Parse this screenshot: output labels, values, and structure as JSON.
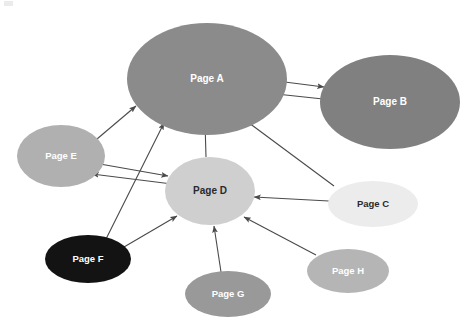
{
  "diagram": {
    "background_color": "#ffffff",
    "width": 473,
    "height": 328,
    "nodes": [
      {
        "id": "A",
        "label": "Page A",
        "cx": 207,
        "cy": 79,
        "rx": 80,
        "ry": 56,
        "fill": "#8b8b8b",
        "text_color": "#ffffff",
        "font_size": 10
      },
      {
        "id": "B",
        "label": "Page B",
        "cx": 390,
        "cy": 102,
        "rx": 70,
        "ry": 47,
        "fill": "#808080",
        "text_color": "#ffffff",
        "font_size": 10
      },
      {
        "id": "C",
        "label": "Page C",
        "cx": 373,
        "cy": 204,
        "rx": 45,
        "ry": 23,
        "fill": "#ececec",
        "text_color": "#2a2a2a",
        "font_size": 9.5
      },
      {
        "id": "D",
        "label": "Page D",
        "cx": 210,
        "cy": 191,
        "rx": 45,
        "ry": 34,
        "fill": "#cfcfcf",
        "text_color": "#2a2a2a",
        "font_size": 10
      },
      {
        "id": "E",
        "label": "Page E",
        "cx": 61,
        "cy": 156,
        "rx": 44,
        "ry": 31,
        "fill": "#b0b0b0",
        "text_color": "#ffffff",
        "font_size": 9.5
      },
      {
        "id": "F",
        "label": "Page F",
        "cx": 88,
        "cy": 259,
        "rx": 43,
        "ry": 24,
        "fill": "#131313",
        "text_color": "#ffffff",
        "font_size": 9.5
      },
      {
        "id": "G",
        "label": "Page G",
        "cx": 228,
        "cy": 294,
        "rx": 43,
        "ry": 23,
        "fill": "#999999",
        "text_color": "#ffffff",
        "font_size": 9.5
      },
      {
        "id": "H",
        "label": "Page H",
        "cx": 348,
        "cy": 271,
        "rx": 41,
        "ry": 22,
        "fill": "#b5b5b5",
        "text_color": "#ffffff",
        "font_size": 9.5
      }
    ],
    "edges": [
      {
        "id": "a-to-b",
        "from": "A",
        "to": "B",
        "x1": 269,
        "y1": 80,
        "x2": 324,
        "y2": 87,
        "arrow_end": true,
        "arrow_start": false
      },
      {
        "id": "b-to-a",
        "from": "B",
        "to": "A",
        "x1": 323,
        "y1": 99,
        "x2": 267,
        "y2": 93,
        "arrow_end": true,
        "arrow_start": false
      },
      {
        "id": "e-to-a",
        "from": "E",
        "to": "A",
        "x1": 97,
        "y1": 139,
        "x2": 136,
        "y2": 106,
        "arrow_end": true,
        "arrow_start": false
      },
      {
        "id": "f-to-a",
        "from": "F",
        "to": "A",
        "x1": 106,
        "y1": 239,
        "x2": 164,
        "y2": 123,
        "arrow_end": true,
        "arrow_start": false
      },
      {
        "id": "d-to-a",
        "from": "D",
        "to": "A",
        "x1": 206,
        "y1": 157,
        "x2": 205,
        "y2": 122,
        "arrow_end": true,
        "arrow_start": false
      },
      {
        "id": "c-to-a",
        "from": "C",
        "to": "A",
        "x1": 334,
        "y1": 186,
        "x2": 241,
        "y2": 117,
        "arrow_end": true,
        "arrow_start": false
      },
      {
        "id": "e-to-d",
        "from": "E",
        "to": "D",
        "x1": 100,
        "y1": 164,
        "x2": 168,
        "y2": 176,
        "arrow_end": true,
        "arrow_start": false
      },
      {
        "id": "d-to-e",
        "from": "D",
        "to": "E",
        "x1": 172,
        "y1": 184,
        "x2": 92,
        "y2": 174,
        "arrow_end": true,
        "arrow_start": false
      },
      {
        "id": "c-to-d",
        "from": "C",
        "to": "D",
        "x1": 329,
        "y1": 201,
        "x2": 254,
        "y2": 197,
        "arrow_end": true,
        "arrow_start": false
      },
      {
        "id": "f-to-d",
        "from": "F",
        "to": "D",
        "x1": 124,
        "y1": 247,
        "x2": 177,
        "y2": 216,
        "arrow_end": true,
        "arrow_start": false
      },
      {
        "id": "g-to-d",
        "from": "G",
        "to": "D",
        "x1": 221,
        "y1": 272,
        "x2": 214,
        "y2": 226,
        "arrow_end": true,
        "arrow_start": false
      },
      {
        "id": "h-to-d",
        "from": "H",
        "to": "D",
        "x1": 316,
        "y1": 255,
        "x2": 244,
        "y2": 217,
        "arrow_end": true,
        "arrow_start": false
      }
    ],
    "edge_style": {
      "stroke": "#4a4a4a",
      "stroke_width": 1.1,
      "arrow_size": 6
    }
  }
}
